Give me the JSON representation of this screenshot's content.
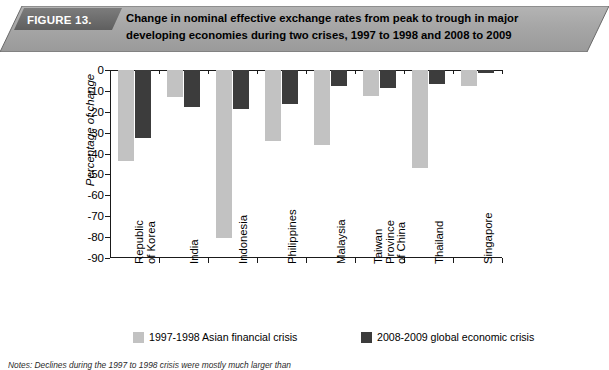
{
  "banner": {
    "figure_label": "FIGURE 13.",
    "title": "Change in nominal effective exchange rates from peak to trough in major developing economies during two crises, 1997 to 1998 and 2008 to 2009",
    "title_line1": "Change in nominal effective exchange rates from peak to trough in major",
    "title_line2": "developing economies during two crises, 1997 to 1998 and 2008 to 2009",
    "banner_fill": "#a8a8a8",
    "figure_block_fill": "#6e6e6e"
  },
  "notes": {
    "text": "Notes: Declines during the 1997 to 1998 crisis were mostly much larger than"
  },
  "legend": {
    "items": [
      {
        "label": "1997-1998 Asian financial crisis",
        "color": "#c2c2c2",
        "key": "crisis_1997"
      },
      {
        "label": "2008-2009 global economic crisis",
        "color": "#3c3c3c",
        "key": "crisis_2008"
      }
    ]
  },
  "axis": {
    "ylabel": "Percentage of change",
    "yticks": [
      "0",
      "-10",
      "-20",
      "-30",
      "-40",
      "-50",
      "-60",
      "-70",
      "-80",
      "-90"
    ]
  },
  "chart_data": {
    "type": "bar",
    "title": "Change in nominal effective exchange rates from peak to trough in major developing economies during two crises, 1997 to 1998 and 2008 to 2009",
    "xlabel": "",
    "ylabel": "Percentage of change",
    "ylim": [
      -90,
      0
    ],
    "ytick_step": 10,
    "grid": false,
    "legend_position": "bottom",
    "categories": [
      "Republic of Korea",
      "India",
      "Indonesia",
      "Philippines",
      "Malaysia",
      "Taiwan Province of China",
      "Thailand",
      "Singapore"
    ],
    "category_lines": [
      [
        "Republic",
        "of Korea"
      ],
      [
        "India"
      ],
      [
        "Indonesia"
      ],
      [
        "Philippines"
      ],
      [
        "Malaysia"
      ],
      [
        "Taiwan",
        "Province",
        "of China"
      ],
      [
        "Thailand"
      ],
      [
        "Singapore"
      ]
    ],
    "series": [
      {
        "name": "1997-1998 Asian financial crisis",
        "color": "#c2c2c2",
        "values": [
          -43.5,
          -12.8,
          -80.5,
          -34.0,
          -35.8,
          -12.5,
          -47.0,
          -7.5
        ]
      },
      {
        "name": "2008-2009 global economic crisis",
        "color": "#3c3c3c",
        "values": [
          -32.5,
          -17.5,
          -18.5,
          -16.5,
          -7.5,
          -8.5,
          -6.5,
          -1.5
        ]
      }
    ]
  }
}
